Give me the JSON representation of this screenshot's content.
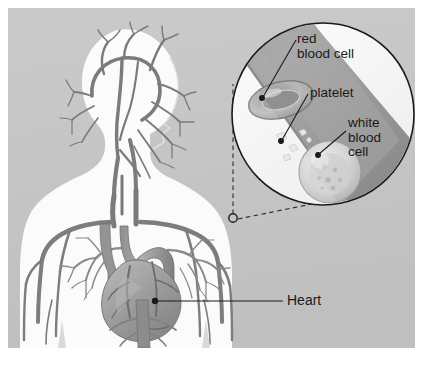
{
  "figure": {
    "background_color": "#c6c6c6",
    "frame_color": "#ffffff",
    "line_color": "#1a1a1a",
    "width": 425,
    "height": 365
  },
  "labels": {
    "red_blood_cell": "red\nblood cell",
    "platelet": "platelet",
    "white_blood_cell": "white\nblood\ncell",
    "heart": "Heart"
  },
  "inset": {
    "shape": "circle",
    "center_x": 323,
    "center_y": 114,
    "radius": 91,
    "vessel_fill": "#9a9a9a",
    "plasma_fill": "#f2f2f2",
    "callout_origin_x": 233,
    "callout_origin_y": 218
  },
  "body": {
    "silhouette_fill": "#fbfbfb",
    "vessel_fill": "#7d7d7d",
    "heart_fill": "#9b9b9b"
  },
  "leaders": [
    {
      "name": "red-blood-cell-leader",
      "x1": 296,
      "y1": 40,
      "x2": 262,
      "y2": 97
    },
    {
      "name": "platelet-leader",
      "x1": 308,
      "y1": 94,
      "x2": 281,
      "y2": 140
    },
    {
      "name": "white-blood-cell-leader",
      "x1": 346,
      "y1": 130,
      "x2": 318,
      "y2": 154
    },
    {
      "name": "heart-leader",
      "x1": 283,
      "y1": 301,
      "x2": 155,
      "y2": 301
    }
  ]
}
